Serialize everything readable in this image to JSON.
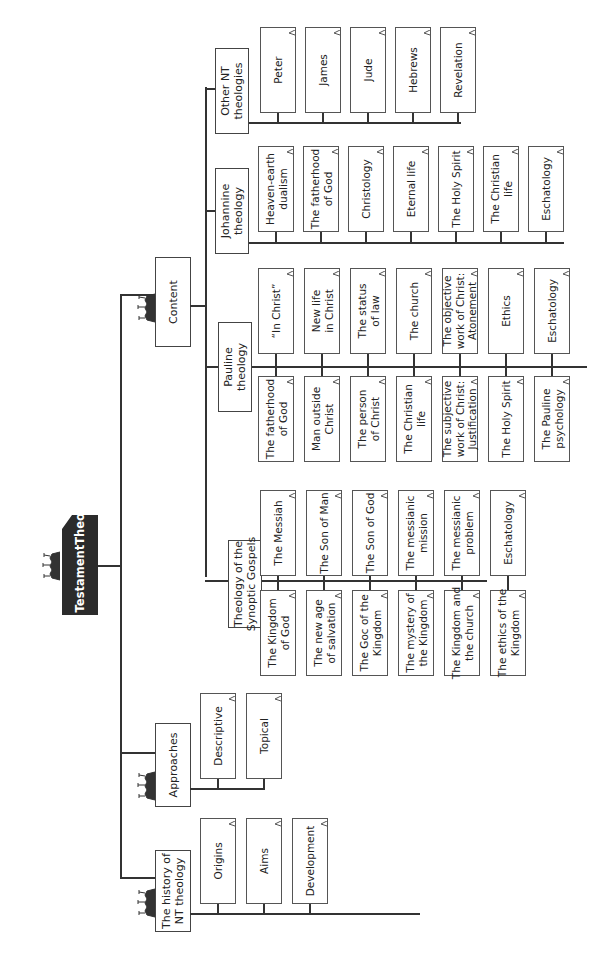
{
  "root": {
    "label_lines": [
      "New Testament",
      "Theology"
    ]
  },
  "branches": {
    "history": {
      "label_lines": [
        "The history of",
        "NT theology"
      ],
      "children": [
        {
          "label_lines": [
            "Origins"
          ]
        },
        {
          "label_lines": [
            "Aims"
          ]
        },
        {
          "label_lines": [
            "Development"
          ]
        }
      ]
    },
    "approaches": {
      "label_lines": [
        "Approaches"
      ],
      "children": [
        {
          "label_lines": [
            "Descriptive"
          ]
        },
        {
          "label_lines": [
            "Topical"
          ]
        }
      ]
    },
    "content": {
      "label_lines": [
        "Content"
      ],
      "sub": {
        "synoptic": {
          "label_lines": [
            "Theology of the",
            "Synoptic Gospels"
          ],
          "top_row": [
            {
              "label_lines": [
                "The Messiah"
              ]
            },
            {
              "label_lines": [
                "The Son of Man"
              ]
            },
            {
              "label_lines": [
                "The Son of God"
              ]
            },
            {
              "label_lines": [
                "The messianic",
                "mission"
              ]
            },
            {
              "label_lines": [
                "The messianic",
                "problem"
              ]
            },
            {
              "label_lines": [
                "Eschatology"
              ]
            }
          ],
          "bottom_row": [
            {
              "label_lines": [
                "The Kingdom",
                "of God"
              ]
            },
            {
              "label_lines": [
                "The new age",
                "of salvation"
              ]
            },
            {
              "label_lines": [
                "The Goc of the",
                "Kingdom"
              ]
            },
            {
              "label_lines": [
                "The mystery of",
                "the Kingdom"
              ]
            },
            {
              "label_lines": [
                "The Kingdom and",
                "the church"
              ]
            },
            {
              "label_lines": [
                "The ethics of the",
                "Kingdom"
              ]
            }
          ]
        },
        "pauline": {
          "label_lines": [
            "Pauline",
            "theology"
          ],
          "top_row": [
            {
              "label_lines": [
                "“In Christ”"
              ]
            },
            {
              "label_lines": [
                "New life",
                "in Christ"
              ]
            },
            {
              "label_lines": [
                "The status",
                "of law"
              ]
            },
            {
              "label_lines": [
                "The church"
              ]
            },
            {
              "label_lines": [
                "The objective",
                "work of Christ:",
                "Atonement"
              ]
            },
            {
              "label_lines": [
                "Ethics"
              ]
            },
            {
              "label_lines": [
                "Eschatology"
              ]
            }
          ],
          "bottom_row": [
            {
              "label_lines": [
                "The fatherhood",
                "of God"
              ]
            },
            {
              "label_lines": [
                "Man outside",
                "Christ"
              ]
            },
            {
              "label_lines": [
                "The person",
                "of Christ"
              ]
            },
            {
              "label_lines": [
                "The Christian",
                "life"
              ]
            },
            {
              "label_lines": [
                "The subjective",
                "work of Christ:",
                "Justification"
              ]
            },
            {
              "label_lines": [
                "The Holy Spirit"
              ]
            },
            {
              "label_lines": [
                "The Pauline",
                "psychology"
              ]
            }
          ]
        },
        "johannine": {
          "label_lines": [
            "Johannine",
            "theology"
          ],
          "children": [
            {
              "label_lines": [
                "Heaven-earth",
                "dualism"
              ]
            },
            {
              "label_lines": [
                "The fatherhood",
                "of God"
              ]
            },
            {
              "label_lines": [
                "Christology"
              ]
            },
            {
              "label_lines": [
                "Eternal life"
              ]
            },
            {
              "label_lines": [
                "The Holy Spirit"
              ]
            },
            {
              "label_lines": [
                "The Christian",
                "life"
              ]
            },
            {
              "label_lines": [
                "Eschatology"
              ]
            }
          ]
        },
        "other": {
          "label_lines": [
            "Other NT",
            "theologies"
          ],
          "children": [
            {
              "label_lines": [
                "Peter"
              ]
            },
            {
              "label_lines": [
                "James"
              ]
            },
            {
              "label_lines": [
                "Jude"
              ]
            },
            {
              "label_lines": [
                "Hebrews"
              ]
            },
            {
              "label_lines": [
                "Revelation"
              ]
            }
          ]
        }
      }
    }
  },
  "colors": {
    "root_fill": "#2b2b2b",
    "line": "#333333",
    "box_border": "#555555",
    "background": "#ffffff"
  }
}
